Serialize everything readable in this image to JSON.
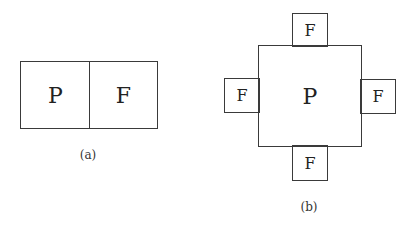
{
  "figure_a": {
    "caption": "(a)",
    "left_box_label": "P",
    "right_box_label": "F"
  },
  "figure_b": {
    "caption": "(b)",
    "center_label": "P",
    "top_label": "F",
    "left_label": "F",
    "right_label": "F",
    "bottom_label": "F"
  }
}
